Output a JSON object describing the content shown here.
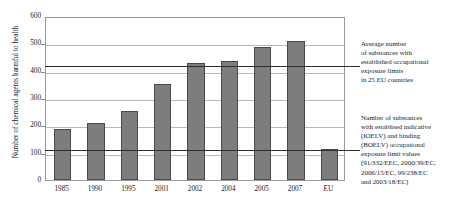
{
  "chart_data": {
    "type": "bar",
    "title": "",
    "xlabel": "",
    "ylabel": "Number of chemical agents harmful to health",
    "categories": [
      "1985",
      "1990",
      "1995",
      "2001",
      "2002",
      "2004",
      "2005",
      "2007",
      "EU"
    ],
    "values": [
      185,
      210,
      252,
      350,
      427,
      435,
      485,
      510,
      115
    ],
    "ylim": [
      0,
      600
    ],
    "yticks": [
      "0",
      "100",
      "200",
      "300",
      "400",
      "500",
      "600"
    ],
    "ytick_values": [
      0,
      100,
      200,
      300,
      400,
      500,
      600
    ],
    "grid": true,
    "legend": "none",
    "bar_color": "#7d7d7d",
    "bar_edge_color": "#4a4a4a",
    "gridline_color": "#b8b8b8",
    "reference_lines": [
      {
        "name": "average-eu-limits",
        "value": 420,
        "color": "#2e2e2e"
      },
      {
        "name": "ioelv-boelv-values",
        "value": 115,
        "color": "#2e2e2e"
      }
    ],
    "annotations": [
      {
        "name": "average-substances-note",
        "reference_value": 420,
        "lines": [
          "Average number",
          "of substances with",
          "established occupational",
          "exposure limits",
          "in 25 EU countries"
        ]
      },
      {
        "name": "ioelv-boelv-note",
        "reference_value": 115,
        "lines": [
          "Number of substances",
          "with establised indicative",
          "(IOELV) and binding",
          "(BOELV) occupational",
          "exposure limit values",
          "(91/332/EEC, 2000/39/EC,",
          "2006/15/EC, 99/238/EC",
          "and 2003/18/EC)"
        ]
      }
    ]
  }
}
